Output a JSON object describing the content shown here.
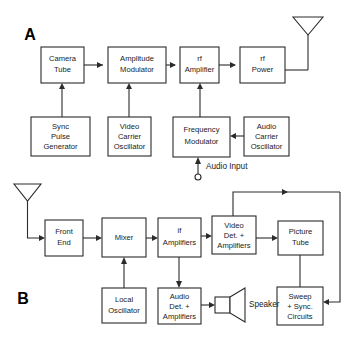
{
  "figure": {
    "kind": "block-diagram",
    "background_color": "#ffffff",
    "line_color": "#2b2b2b",
    "text_color": "#1a1a1a"
  },
  "panels": [
    {
      "id": "A",
      "label": "A",
      "caption": "television transmitter block diagram"
    },
    {
      "id": "B",
      "label": "B",
      "caption": "television receiver block diagram"
    }
  ],
  "panel_a": {
    "label": "A",
    "blocks": {
      "camera_tube": {
        "lines": [
          "Camera",
          "Tube"
        ]
      },
      "amplitude_modulator": {
        "lines": [
          "Amplitude",
          "Modulator"
        ]
      },
      "rf_amplifier": {
        "lines": [
          "rf",
          "Amplifier"
        ]
      },
      "rf_power": {
        "lines": [
          "rf",
          "Power"
        ]
      },
      "sync_pulse_generator": {
        "lines": [
          "Sync",
          "Pulse",
          "Generator"
        ]
      },
      "video_carrier_oscillator": {
        "lines": [
          "Video",
          "Carrier",
          "Oscillator"
        ]
      },
      "frequency_modulator": {
        "lines": [
          "Frequency",
          "Modulator"
        ]
      },
      "audio_carrier_oscillator": {
        "lines": [
          "Audio",
          "Carrier",
          "Oscillator"
        ]
      }
    },
    "annotations": {
      "audio_input": "Audio Input"
    },
    "icons": {
      "transmit_antenna": "antenna-icon",
      "audio_input_terminal": "terminal-circle-icon"
    }
  },
  "panel_b": {
    "label": "B",
    "blocks": {
      "front_end": {
        "lines": [
          "Front",
          "End"
        ]
      },
      "mixer": {
        "lines": [
          "Mixer"
        ]
      },
      "if_amplifiers": {
        "lines": [
          "if",
          "Amplifiers"
        ]
      },
      "video_det_amplifiers": {
        "lines": [
          "Video",
          "Det. +",
          "Amplifiers"
        ]
      },
      "picture_tube": {
        "lines": [
          "Picture",
          "Tube"
        ]
      },
      "local_oscillator": {
        "lines": [
          "Local",
          "Oscillator"
        ]
      },
      "audio_det_amplifiers": {
        "lines": [
          "Audio",
          "Det. +",
          "Amplifiers"
        ]
      },
      "sweep_sync_circuits": {
        "lines": [
          "Sweep",
          "+ Sync.",
          "Circuits"
        ]
      }
    },
    "annotations": {
      "speaker": "Speaker"
    },
    "icons": {
      "receive_antenna": "antenna-icon",
      "speaker": "speaker-icon"
    }
  }
}
